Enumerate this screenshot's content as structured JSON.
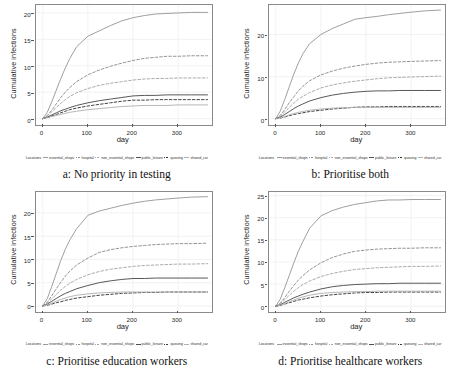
{
  "figure": {
    "axis": {
      "xlabel": "day",
      "ylabel": "Cumulative infections"
    },
    "legend": {
      "title": "Locations",
      "entries": [
        {
          "label": "essential_shops",
          "color": "#9a9a9a",
          "dash": "solid"
        },
        {
          "label": "hospital",
          "color": "#8e8e8e",
          "dash": "dashed"
        },
        {
          "label": "non_essential_shops",
          "color": "#a6a6a6",
          "dash": "dashed"
        },
        {
          "label": "public_leisure",
          "color": "#4f4f4f",
          "dash": "solid"
        },
        {
          "label": "queuing",
          "color": "#3a3a3a",
          "dash": "dashed"
        },
        {
          "label": "shared_car",
          "color": "#b2b2b2",
          "dash": "solid"
        }
      ]
    }
  },
  "chart_data": [
    {
      "type": "line",
      "panel": "a",
      "caption": "a: No priority in testing",
      "title": "",
      "xlabel": "day",
      "ylabel": "Cumulative infections",
      "xlim": [
        -15,
        375
      ],
      "ylim": [
        -1.2,
        21.5
      ],
      "xticks": [
        0,
        100,
        200,
        300
      ],
      "yticks": [
        0,
        5,
        10,
        15,
        20
      ],
      "grid": true,
      "legend_position": "bottom",
      "x": [
        0,
        10,
        20,
        30,
        40,
        50,
        60,
        75,
        100,
        125,
        150,
        175,
        200,
        225,
        250,
        275,
        300,
        330,
        365
      ],
      "series": [
        {
          "name": "essential_shops",
          "values": [
            0.0,
            1.2,
            3.2,
            5.4,
            7.6,
            9.6,
            11.4,
            13.6,
            15.6,
            16.6,
            17.6,
            18.5,
            19.1,
            19.5,
            19.8,
            19.9,
            20.0,
            20.1,
            20.1
          ]
        },
        {
          "name": "hospital",
          "values": [
            0.0,
            0.6,
            1.6,
            2.8,
            4.0,
            5.0,
            5.9,
            7.0,
            8.3,
            9.2,
            9.9,
            10.5,
            11.0,
            11.4,
            11.6,
            11.8,
            11.8,
            11.9,
            11.9
          ]
        },
        {
          "name": "non_essential_shops",
          "values": [
            0.0,
            0.5,
            1.3,
            2.1,
            2.9,
            3.6,
            4.2,
            4.9,
            5.7,
            6.3,
            6.7,
            7.0,
            7.3,
            7.5,
            7.6,
            7.6,
            7.7,
            7.7,
            7.7
          ]
        },
        {
          "name": "public_leisure",
          "values": [
            0.0,
            0.3,
            0.7,
            1.1,
            1.5,
            1.8,
            2.1,
            2.5,
            3.0,
            3.4,
            3.7,
            4.0,
            4.3,
            4.4,
            4.4,
            4.5,
            4.5,
            4.5,
            4.5
          ]
        },
        {
          "name": "queuing",
          "values": [
            0.0,
            0.2,
            0.5,
            0.8,
            1.1,
            1.4,
            1.7,
            2.0,
            2.4,
            2.7,
            3.0,
            3.3,
            3.5,
            3.5,
            3.6,
            3.6,
            3.6,
            3.6,
            3.6
          ]
        },
        {
          "name": "shared_car",
          "values": [
            0.0,
            0.2,
            0.4,
            0.6,
            0.8,
            1.0,
            1.2,
            1.4,
            1.7,
            1.9,
            2.1,
            2.3,
            2.4,
            2.5,
            2.5,
            2.5,
            2.6,
            2.6,
            2.6
          ]
        }
      ]
    },
    {
      "type": "line",
      "panel": "b",
      "caption": "b: Prioritise both",
      "title": "",
      "xlabel": "day",
      "ylabel": "Cumulative infections",
      "xlim": [
        -15,
        375
      ],
      "ylim": [
        -1.5,
        27.0
      ],
      "xticks": [
        0,
        100,
        200,
        300
      ],
      "yticks": [
        0,
        10,
        20
      ],
      "grid": true,
      "legend_position": "bottom",
      "x": [
        0,
        10,
        20,
        30,
        40,
        50,
        60,
        75,
        100,
        125,
        150,
        175,
        200,
        225,
        250,
        275,
        300,
        330,
        365
      ],
      "series": [
        {
          "name": "essential_shops",
          "values": [
            0.0,
            1.8,
            4.6,
            7.6,
            10.6,
            13.2,
            15.4,
            17.8,
            20.0,
            21.4,
            22.5,
            23.6,
            24.0,
            24.3,
            24.7,
            25.0,
            25.3,
            25.6,
            25.8
          ]
        },
        {
          "name": "hospital",
          "values": [
            0.0,
            0.8,
            2.2,
            3.8,
            5.2,
            6.6,
            7.7,
            9.0,
            10.4,
            11.3,
            12.0,
            12.5,
            12.9,
            13.2,
            13.4,
            13.5,
            13.6,
            13.7,
            13.8
          ]
        },
        {
          "name": "non_essential_shops",
          "values": [
            0.0,
            0.6,
            1.6,
            2.7,
            3.7,
            4.6,
            5.3,
            6.2,
            7.3,
            8.0,
            8.5,
            8.9,
            9.2,
            9.5,
            9.7,
            9.8,
            9.9,
            10.0,
            10.1
          ]
        },
        {
          "name": "public_leisure",
          "values": [
            0.0,
            0.4,
            1.0,
            1.7,
            2.4,
            3.0,
            3.5,
            4.2,
            5.0,
            5.6,
            6.0,
            6.3,
            6.5,
            6.6,
            6.6,
            6.7,
            6.7,
            6.7,
            6.7
          ]
        },
        {
          "name": "queuing",
          "values": [
            0.0,
            0.15,
            0.4,
            0.7,
            1.0,
            1.2,
            1.4,
            1.7,
            2.0,
            2.3,
            2.5,
            2.7,
            2.8,
            2.8,
            2.9,
            2.9,
            2.9,
            2.9,
            2.9
          ]
        },
        {
          "name": "shared_car",
          "values": [
            0.0,
            0.2,
            0.5,
            0.9,
            1.2,
            1.5,
            1.7,
            2.0,
            2.3,
            2.5,
            2.6,
            2.7,
            2.7,
            2.7,
            2.7,
            2.7,
            2.7,
            2.7,
            2.7
          ]
        }
      ]
    },
    {
      "type": "line",
      "panel": "c",
      "caption": "c: Prioritise education workers",
      "title": "",
      "xlabel": "day",
      "ylabel": "Cumulative infections",
      "xlim": [
        -15,
        375
      ],
      "ylim": [
        -1.3,
        24.5
      ],
      "xticks": [
        0,
        100,
        200,
        300
      ],
      "yticks": [
        0,
        5,
        10,
        15,
        20
      ],
      "grid": true,
      "legend_position": "bottom",
      "x": [
        0,
        10,
        20,
        30,
        40,
        50,
        60,
        75,
        100,
        125,
        150,
        175,
        200,
        225,
        250,
        275,
        300,
        330,
        365
      ],
      "series": [
        {
          "name": "essential_shops",
          "values": [
            0.0,
            1.6,
            4.2,
            7.0,
            9.8,
            12.2,
            14.2,
            16.6,
            19.5,
            20.4,
            21.0,
            21.6,
            22.1,
            22.5,
            22.8,
            23.0,
            23.2,
            23.4,
            23.5
          ]
        },
        {
          "name": "hospital",
          "values": [
            0.0,
            0.8,
            2.2,
            3.7,
            5.1,
            6.4,
            7.5,
            8.8,
            10.3,
            11.5,
            12.1,
            12.5,
            12.8,
            13.0,
            13.2,
            13.3,
            13.4,
            13.4,
            13.5
          ]
        },
        {
          "name": "non_essential_shops",
          "values": [
            0.0,
            0.6,
            1.5,
            2.5,
            3.4,
            4.2,
            4.9,
            5.7,
            6.7,
            7.4,
            7.9,
            8.2,
            8.5,
            8.7,
            8.8,
            8.9,
            9.0,
            9.0,
            9.1
          ]
        },
        {
          "name": "public_leisure",
          "values": [
            0.0,
            0.4,
            1.0,
            1.6,
            2.2,
            2.7,
            3.1,
            3.7,
            4.4,
            5.0,
            5.4,
            5.7,
            5.9,
            5.9,
            6.0,
            6.0,
            6.0,
            6.0,
            6.0
          ]
        },
        {
          "name": "queuing",
          "values": [
            0.0,
            0.15,
            0.4,
            0.7,
            0.9,
            1.2,
            1.4,
            1.7,
            2.0,
            2.3,
            2.5,
            2.7,
            2.8,
            2.9,
            2.9,
            3.0,
            3.0,
            3.0,
            3.0
          ]
        },
        {
          "name": "shared_car",
          "values": [
            0.0,
            0.25,
            0.6,
            1.0,
            1.4,
            1.7,
            2.0,
            2.3,
            2.6,
            2.8,
            2.9,
            3.0,
            3.0,
            3.0,
            3.0,
            3.0,
            3.0,
            3.0,
            3.0
          ]
        }
      ]
    },
    {
      "type": "line",
      "panel": "d",
      "caption": "d: Prioritise healthcare workers",
      "title": "",
      "xlabel": "day",
      "ylabel": "Cumulative infections",
      "xlim": [
        -15,
        375
      ],
      "ylim": [
        -1.3,
        25.8
      ],
      "xticks": [
        0,
        100,
        200,
        300
      ],
      "yticks": [
        0,
        5,
        10,
        15,
        20,
        25
      ],
      "grid": true,
      "legend_position": "bottom",
      "x": [
        0,
        10,
        20,
        30,
        40,
        50,
        60,
        75,
        100,
        125,
        150,
        175,
        200,
        225,
        250,
        275,
        300,
        330,
        365
      ],
      "series": [
        {
          "name": "essential_shops",
          "values": [
            0.0,
            1.6,
            4.2,
            7.0,
            9.8,
            12.4,
            14.6,
            17.6,
            20.4,
            21.6,
            22.4,
            23.0,
            23.4,
            23.8,
            24.0,
            24.0,
            24.1,
            24.1,
            24.1
          ]
        },
        {
          "name": "hospital",
          "values": [
            0.0,
            0.7,
            2.0,
            3.4,
            4.7,
            5.9,
            6.9,
            8.2,
            9.8,
            11.0,
            11.8,
            12.4,
            12.7,
            12.9,
            13.0,
            13.1,
            13.1,
            13.2,
            13.2
          ]
        },
        {
          "name": "non_essential_shops",
          "values": [
            0.0,
            0.6,
            1.5,
            2.5,
            3.4,
            4.2,
            4.9,
            5.7,
            6.7,
            7.4,
            7.9,
            8.3,
            8.5,
            8.7,
            8.8,
            8.9,
            9.0,
            9.0,
            9.1
          ]
        },
        {
          "name": "public_leisure",
          "values": [
            0.0,
            0.35,
            0.9,
            1.4,
            1.9,
            2.3,
            2.7,
            3.2,
            3.9,
            4.4,
            4.7,
            4.9,
            5.0,
            5.1,
            5.1,
            5.2,
            5.2,
            5.2,
            5.2
          ]
        },
        {
          "name": "queuing",
          "values": [
            0.0,
            0.2,
            0.5,
            0.8,
            1.1,
            1.4,
            1.6,
            1.9,
            2.3,
            2.6,
            2.8,
            3.0,
            3.1,
            3.1,
            3.2,
            3.2,
            3.2,
            3.2,
            3.2
          ]
        },
        {
          "name": "shared_car",
          "values": [
            0.0,
            0.25,
            0.6,
            1.0,
            1.4,
            1.8,
            2.1,
            2.5,
            2.9,
            3.1,
            3.2,
            3.3,
            3.3,
            3.4,
            3.4,
            3.4,
            3.4,
            3.4,
            3.4
          ]
        }
      ]
    }
  ]
}
